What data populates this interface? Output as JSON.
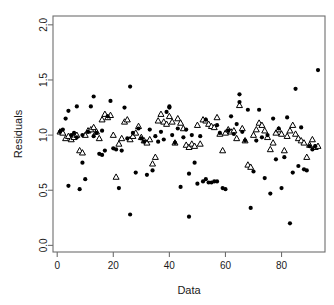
{
  "chart_data": {
    "type": "scatter",
    "title": "",
    "xlabel": "Data",
    "ylabel": "Residuals",
    "xlim": [
      -1.5,
      95.5
    ],
    "ylim": [
      -0.06,
      2.08
    ],
    "xticks": [
      0,
      20,
      40,
      60,
      80
    ],
    "xtick_labels": [
      "0",
      "20",
      "40",
      "60",
      "80"
    ],
    "yticks": [
      0.0,
      0.5,
      1.0,
      1.5,
      2.0
    ],
    "ytick_labels": [
      "0.0",
      "0.5",
      "1.0",
      "1.5",
      "2.0"
    ],
    "grid": false,
    "legend": "none",
    "box": true,
    "series": [
      {
        "name": "residuals",
        "marker": "filled-circle",
        "color": "#000000",
        "size": 4.2,
        "points": [
          [
            1,
            1.03
          ],
          [
            2,
            1.05
          ],
          [
            3,
            1.15
          ],
          [
            4,
            1.22
          ],
          [
            4,
            0.54
          ],
          [
            5,
            1.0
          ],
          [
            6,
            1.02
          ],
          [
            7,
            1.26
          ],
          [
            7,
            0.98
          ],
          [
            8,
            0.51
          ],
          [
            9,
            0.75
          ],
          [
            9,
            1.0
          ],
          [
            10,
            0.6
          ],
          [
            11,
            1.03
          ],
          [
            12,
            1.26
          ],
          [
            13,
            0.99
          ],
          [
            13,
            1.35
          ],
          [
            14,
            1.02
          ],
          [
            15,
            0.83
          ],
          [
            16,
            0.82
          ],
          [
            16,
            1.04
          ],
          [
            17,
            0.86
          ],
          [
            18,
            1.17
          ],
          [
            19,
            1.31
          ],
          [
            20,
            0.88
          ],
          [
            21,
            0.87
          ],
          [
            22,
            0.52
          ],
          [
            23,
            0.86
          ],
          [
            24,
            1.25
          ],
          [
            25,
            0.97
          ],
          [
            26,
            1.44
          ],
          [
            26,
            0.28
          ],
          [
            27,
            1.02
          ],
          [
            28,
            0.66
          ],
          [
            29,
            1.06
          ],
          [
            30,
            0.97
          ],
          [
            31,
            0.94
          ],
          [
            32,
            0.64
          ],
          [
            33,
            1.05
          ],
          [
            34,
            0.68
          ],
          [
            35,
            0.99
          ],
          [
            36,
            0.94
          ],
          [
            37,
            1.03
          ],
          [
            38,
            0.96
          ],
          [
            39,
            1.21
          ],
          [
            40,
            1.25
          ],
          [
            40,
            1.26
          ],
          [
            41,
            1.0
          ],
          [
            42,
            0.93
          ],
          [
            43,
            1.06
          ],
          [
            44,
            0.53
          ],
          [
            45,
            0.98
          ],
          [
            46,
            1.05
          ],
          [
            47,
            0.65
          ],
          [
            47,
            0.26
          ],
          [
            48,
            1.0
          ],
          [
            49,
            0.75
          ],
          [
            50,
            0.56
          ],
          [
            51,
            0.99
          ],
          [
            52,
            0.58
          ],
          [
            53,
            0.6
          ],
          [
            53,
            1.14
          ],
          [
            54,
            0.57
          ],
          [
            55,
            0.57
          ],
          [
            56,
            0.58
          ],
          [
            57,
            1.09
          ],
          [
            57,
            0.58
          ],
          [
            58,
            1.02
          ],
          [
            59,
            0.52
          ],
          [
            60,
            0.51
          ],
          [
            61,
            1.04
          ],
          [
            62,
            1.17
          ],
          [
            63,
            1.01
          ],
          [
            64,
            1.1
          ],
          [
            65,
            1.37
          ],
          [
            65,
            1.3
          ],
          [
            66,
            1.03
          ],
          [
            67,
            0.95
          ],
          [
            68,
            1.23
          ],
          [
            69,
            0.34
          ],
          [
            70,
            0.67
          ],
          [
            71,
            0.95
          ],
          [
            72,
            1.23
          ],
          [
            73,
            0.98
          ],
          [
            74,
            0.61
          ],
          [
            75,
            1.0
          ],
          [
            76,
            0.47
          ],
          [
            77,
            1.15
          ],
          [
            78,
            0.78
          ],
          [
            79,
            1.06
          ],
          [
            80,
            0.52
          ],
          [
            81,
            0.8
          ],
          [
            82,
            1.16
          ],
          [
            83,
            0.2
          ],
          [
            84,
            0.66
          ],
          [
            85,
            1.42
          ],
          [
            86,
            0.72
          ],
          [
            87,
            1.07
          ],
          [
            88,
            0.69
          ],
          [
            89,
            0.68
          ],
          [
            90,
            0.9
          ],
          [
            91,
            0.87
          ],
          [
            92,
            0.9
          ],
          [
            93,
            1.59
          ]
        ]
      },
      {
        "name": "fitted",
        "marker": "open-triangle",
        "color": "#000000",
        "size": 5.0,
        "points": [
          [
            1,
            1.03
          ],
          [
            2,
            1.02
          ],
          [
            3,
            0.97
          ],
          [
            4,
            0.99
          ],
          [
            5,
            0.96
          ],
          [
            6,
            0.98
          ],
          [
            7,
            1.0
          ],
          [
            8,
            0.86
          ],
          [
            9,
            0.84
          ],
          [
            10,
            1.0
          ],
          [
            11,
            1.04
          ],
          [
            12,
            1.05
          ],
          [
            13,
            1.07
          ],
          [
            14,
            1.03
          ],
          [
            15,
            0.97
          ],
          [
            16,
            1.14
          ],
          [
            17,
            1.19
          ],
          [
            18,
            1.16
          ],
          [
            19,
            1.18
          ],
          [
            20,
            1.0
          ],
          [
            21,
            0.62
          ],
          [
            22,
            0.92
          ],
          [
            23,
            0.97
          ],
          [
            24,
            1.12
          ],
          [
            25,
            1.14
          ],
          [
            26,
            0.96
          ],
          [
            27,
            0.99
          ],
          [
            28,
            1.02
          ],
          [
            29,
            1.08
          ],
          [
            30,
            0.98
          ],
          [
            31,
            0.95
          ],
          [
            32,
            0.93
          ],
          [
            33,
            0.96
          ],
          [
            34,
            0.74
          ],
          [
            35,
            0.8
          ],
          [
            36,
            1.13
          ],
          [
            37,
            1.19
          ],
          [
            38,
            1.12
          ],
          [
            39,
            1.1
          ],
          [
            40,
            1.17
          ],
          [
            41,
            1.12
          ],
          [
            42,
            0.93
          ],
          [
            43,
            1.15
          ],
          [
            44,
            1.11
          ],
          [
            45,
            1.06
          ],
          [
            46,
            0.91
          ],
          [
            47,
            0.89
          ],
          [
            48,
            0.92
          ],
          [
            49,
            0.9
          ],
          [
            50,
            1.09
          ],
          [
            51,
            0.92
          ],
          [
            52,
            1.14
          ],
          [
            53,
            1.13
          ],
          [
            54,
            1.1
          ],
          [
            55,
            1.08
          ],
          [
            56,
            1.07
          ],
          [
            57,
            1.16
          ],
          [
            58,
            1.01
          ],
          [
            59,
            0.86
          ],
          [
            60,
            1.02
          ],
          [
            61,
            1.05
          ],
          [
            62,
            1.03
          ],
          [
            63,
            1.04
          ],
          [
            64,
            0.97
          ],
          [
            65,
            1.27
          ],
          [
            66,
            1.06
          ],
          [
            67,
            0.95
          ],
          [
            68,
            0.73
          ],
          [
            69,
            0.71
          ],
          [
            70,
            1.0
          ],
          [
            71,
            1.05
          ],
          [
            72,
            1.11
          ],
          [
            73,
            1.09
          ],
          [
            74,
            1.04
          ],
          [
            75,
            0.98
          ],
          [
            76,
            0.87
          ],
          [
            77,
            0.93
          ],
          [
            78,
            1.02
          ],
          [
            79,
            1.05
          ],
          [
            80,
            1.01
          ],
          [
            81,
            0.86
          ],
          [
            82,
            0.99
          ],
          [
            83,
            1.04
          ],
          [
            84,
            1.09
          ],
          [
            85,
            1.01
          ],
          [
            86,
            0.97
          ],
          [
            87,
            0.95
          ],
          [
            88,
            0.93
          ],
          [
            89,
            0.8
          ],
          [
            90,
            0.91
          ],
          [
            91,
            0.96
          ],
          [
            92,
            0.89
          ],
          [
            93,
            0.9
          ]
        ]
      }
    ]
  }
}
